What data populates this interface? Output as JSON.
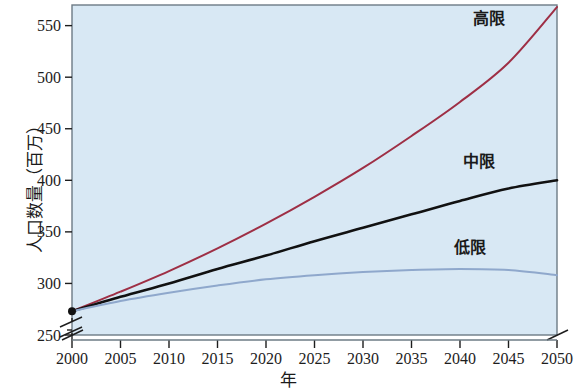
{
  "chart_data": {
    "type": "line",
    "title": "",
    "xlabel": "年",
    "ylabel": "人口数量（百万）",
    "xlim": [
      2000,
      2050
    ],
    "ylim": [
      250,
      570
    ],
    "y_axis_break": true,
    "grid": false,
    "legend_position": "inline-right",
    "background_color": "#d8e8f4",
    "x": [
      2000,
      2005,
      2010,
      2015,
      2020,
      2025,
      2030,
      2035,
      2040,
      2045,
      2050
    ],
    "xticks": [
      "2000",
      "2005",
      "2010",
      "2015",
      "2020",
      "2025",
      "2030",
      "2035",
      "2040",
      "2045",
      "2050"
    ],
    "yticks": [
      "250",
      "300",
      "350",
      "400",
      "450",
      "500",
      "550"
    ],
    "ytick_values": [
      250,
      300,
      350,
      400,
      450,
      500,
      550
    ],
    "series": [
      {
        "name": "高限",
        "color": "#9e2f45",
        "label_x": 2043,
        "label_y": 552,
        "values": [
          273,
          292,
          312,
          334,
          358,
          384,
          412,
          443,
          476,
          514,
          568
        ]
      },
      {
        "name": "中限",
        "color": "#111111",
        "label_x": 2042,
        "label_y": 413,
        "values": [
          273,
          287,
          300,
          314,
          327,
          341,
          354,
          367,
          380,
          392,
          400
        ]
      },
      {
        "name": "低限",
        "color": "#8fa8cc",
        "label_x": 2041,
        "label_y": 330,
        "values": [
          273,
          283,
          291,
          298,
          304,
          308,
          311,
          313,
          314,
          313,
          308
        ]
      }
    ],
    "start_marker": {
      "x": 2000,
      "y": 273,
      "color": "#111111"
    }
  }
}
